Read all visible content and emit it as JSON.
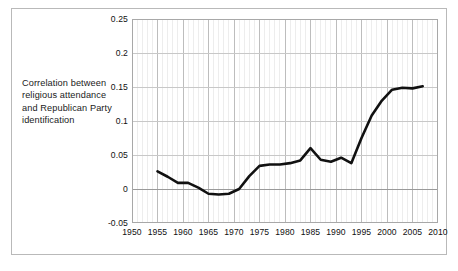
{
  "figure": {
    "caption": "Correlation between religious attendance and Republican Party identification"
  },
  "chart_data": {
    "type": "line",
    "title": "",
    "subtitle": "",
    "xlabel": "",
    "ylabel": "Correlation between religious attendance and Republican Party identification",
    "xlim": [
      1950,
      2010
    ],
    "ylim": [
      -0.05,
      0.25
    ],
    "xticks": [
      1950,
      1955,
      1960,
      1965,
      1970,
      1975,
      1980,
      1985,
      1990,
      1995,
      2000,
      2005,
      2010
    ],
    "yticks": [
      -0.05,
      0,
      0.05,
      0.1,
      0.15,
      0.2,
      0.25
    ],
    "xtick_labels": [
      "1950",
      "1955",
      "1960",
      "1965",
      "1970",
      "1975",
      "1980",
      "1985",
      "1990",
      "1995",
      "2000",
      "2005",
      "2010"
    ],
    "ytick_labels": [
      "-0.05",
      "0",
      "0.05",
      "0.1",
      "0.15",
      "0.2",
      "0.25"
    ],
    "grid": true,
    "grid_minor_x_step": 1,
    "legend": false,
    "legend_position": "none",
    "line_color": "#111111",
    "line_width": 2.6,
    "zero_line": 0,
    "series": [
      {
        "name": "Correlation between religious attendance and Republican Party identification",
        "x": [
          1955,
          1957,
          1959,
          1961,
          1963,
          1965,
          1967,
          1969,
          1971,
          1973,
          1975,
          1977,
          1979,
          1981,
          1983,
          1985,
          1987,
          1989,
          1991,
          1993,
          1995,
          1997,
          1999,
          2001,
          2003,
          2005,
          2007
        ],
        "values": [
          0.026,
          0.018,
          0.009,
          0.009,
          0.002,
          -0.007,
          -0.008,
          -0.007,
          0.0,
          0.019,
          0.034,
          0.036,
          0.036,
          0.038,
          0.042,
          0.06,
          0.043,
          0.04,
          0.046,
          0.038,
          0.075,
          0.108,
          0.13,
          0.146,
          0.149,
          0.148,
          0.151
        ]
      }
    ]
  }
}
